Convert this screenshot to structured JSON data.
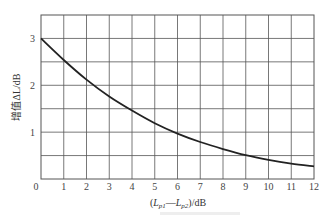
{
  "chart_data": {
    "type": "line",
    "title": "",
    "xlabel": "(L_p1—L_p2)/dB",
    "ylabel": "增值ΔL/dB",
    "x": [
      0,
      1,
      2,
      3,
      4,
      5,
      6,
      7,
      8,
      9,
      10,
      11,
      12
    ],
    "series": [
      {
        "name": "ΔL",
        "values": [
          3.0,
          2.54,
          2.12,
          1.76,
          1.46,
          1.19,
          0.97,
          0.79,
          0.64,
          0.51,
          0.41,
          0.33,
          0.27
        ]
      }
    ],
    "xlim": [
      0,
      12
    ],
    "ylim": [
      0,
      3.5
    ],
    "x_ticks": [
      "0",
      "1",
      "2",
      "3",
      "4",
      "5",
      "6",
      "7",
      "8",
      "9",
      "10",
      "11",
      "12"
    ],
    "y_ticks": [
      {
        "value": 1,
        "label": "1"
      },
      {
        "value": 2,
        "label": "2"
      },
      {
        "value": 3,
        "label": "3"
      }
    ],
    "grid": true,
    "grid_x_step": 1,
    "grid_y_step": 0.5,
    "legend": "none",
    "line_color": "#222222",
    "grid_color": "#555555"
  },
  "labels": {
    "xlabel_prefix": "(",
    "xlabel_L1": "L",
    "xlabel_sub1": "p1",
    "xlabel_dash": "—",
    "xlabel_L2": "L",
    "xlabel_sub2": "p2",
    "xlabel_suffix": ")/dB",
    "ylabel": "增值ΔL/dB",
    "origin": "0"
  }
}
